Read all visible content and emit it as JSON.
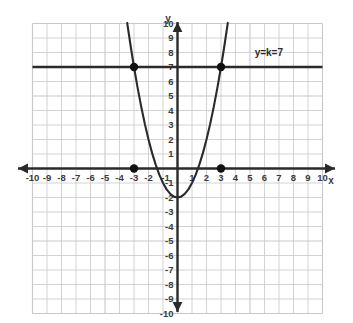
{
  "chart_data": {
    "type": "line",
    "title": "",
    "xlabel": "x",
    "ylabel": "y",
    "xlim": [
      -10,
      10
    ],
    "ylim": [
      -10,
      10
    ],
    "grid": true,
    "legend": "none",
    "x_ticks": [
      "-10",
      "-9",
      "-8",
      "-7",
      "-6",
      "-5",
      "-4",
      "-3",
      "-2",
      "-1",
      "1",
      "2",
      "3",
      "4",
      "5",
      "6",
      "7",
      "8",
      "9",
      "10"
    ],
    "y_ticks": [
      "10",
      "9",
      "8",
      "7",
      "6",
      "5",
      "4",
      "3",
      "2",
      "1",
      "-1",
      "-2",
      "-3",
      "-4",
      "-5",
      "-6",
      "-7",
      "-8",
      "-9",
      "-10"
    ],
    "series": [
      {
        "name": "parabola",
        "type": "curve",
        "equation": "y = x^2 - 2",
        "vertex": [
          0,
          -2
        ],
        "x": [
          -3.47,
          -3.2,
          -3,
          -2.75,
          -2.5,
          -2.25,
          -2,
          -1.75,
          -1.5,
          -1.25,
          -1,
          -0.75,
          -0.5,
          -0.25,
          0,
          0.25,
          0.5,
          0.75,
          1,
          1.25,
          1.5,
          1.75,
          2,
          2.25,
          2.5,
          2.75,
          3,
          3.2,
          3.47
        ],
        "y": [
          10.04,
          8.24,
          7,
          5.56,
          4.25,
          3.06,
          2,
          1.06,
          0.25,
          -0.44,
          -1,
          -1.44,
          -1.75,
          -1.94,
          -2,
          -1.94,
          -1.75,
          -1.44,
          -1,
          -0.44,
          0.25,
          1.06,
          2,
          3.06,
          4.25,
          5.56,
          7,
          8.24,
          10.04
        ]
      },
      {
        "name": "horizontal-line",
        "type": "line",
        "equation": "y = 7",
        "label": "y=k=7",
        "x": [
          -10,
          10
        ],
        "y": [
          7,
          7
        ]
      }
    ],
    "points": [
      {
        "label": "",
        "x": -3,
        "y": 7
      },
      {
        "label": "",
        "x": 3,
        "y": 7
      },
      {
        "label": "",
        "x": -3,
        "y": 0
      },
      {
        "label": "",
        "x": 3,
        "y": 0
      }
    ],
    "annotations": [
      {
        "text": "y=k=7",
        "x": 6.3,
        "y": 7.75
      }
    ],
    "colors": {
      "background": "#ffffff",
      "grid": "#c8c8cc",
      "axis": "#2a2a2a",
      "curve": "#2a2a2a",
      "line": "#2a2a2a",
      "point": "#111111",
      "tick_text": "#3b3b3b"
    }
  }
}
